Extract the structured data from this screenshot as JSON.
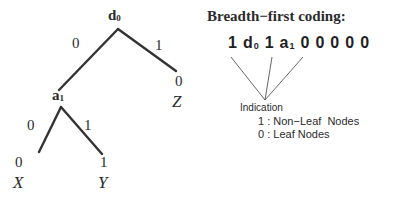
{
  "figure": {
    "background_color": "#ffffff",
    "ink_color": "#2b2b2b",
    "thin_line_color": "#555555"
  },
  "tree": {
    "nodes": [
      {
        "id": "root",
        "label": "d",
        "sub": "0",
        "x": 117,
        "y": 27,
        "type": "non-leaf"
      },
      {
        "id": "inner",
        "label": "a",
        "sub": "1",
        "x": 60,
        "y": 105,
        "type": "non-leaf"
      },
      {
        "id": "leafX",
        "label": "X",
        "x": 38,
        "y": 160,
        "type": "leaf"
      },
      {
        "id": "leafY",
        "label": "Y",
        "x": 103,
        "y": 160,
        "type": "leaf"
      },
      {
        "id": "leafZ",
        "label": "Z",
        "x": 178,
        "y": 75,
        "type": "leaf"
      }
    ],
    "node_labels": {
      "root": "d",
      "root_sub": "0",
      "inner": "a",
      "inner_sub": "1",
      "leaf_x": "X",
      "leaf_y": "Y",
      "leaf_z": "Z"
    },
    "edge_labels": {
      "root_left": "0",
      "root_right": "1",
      "inner_left": "0",
      "inner_right": "1"
    },
    "leaf_bits": {
      "x": "0",
      "y": "1",
      "z": "0"
    }
  },
  "panel": {
    "title": "Breadth−first coding:",
    "code_tokens": [
      {
        "text": "1",
        "sub": ""
      },
      {
        "text": "d",
        "sub": "0"
      },
      {
        "text": "1",
        "sub": ""
      },
      {
        "text": "a",
        "sub": "1"
      },
      {
        "text": "0",
        "sub": ""
      },
      {
        "text": "0",
        "sub": ""
      },
      {
        "text": "0",
        "sub": ""
      },
      {
        "text": "0",
        "sub": ""
      },
      {
        "text": "0",
        "sub": ""
      }
    ],
    "indication": {
      "heading": "Indication",
      "rows": [
        {
          "bit": "1",
          "sep": " : ",
          "meaning": "Non−Leaf  Nodes"
        },
        {
          "bit": "0",
          "sep": " : ",
          "meaning": "Leaf Nodes"
        }
      ]
    }
  }
}
